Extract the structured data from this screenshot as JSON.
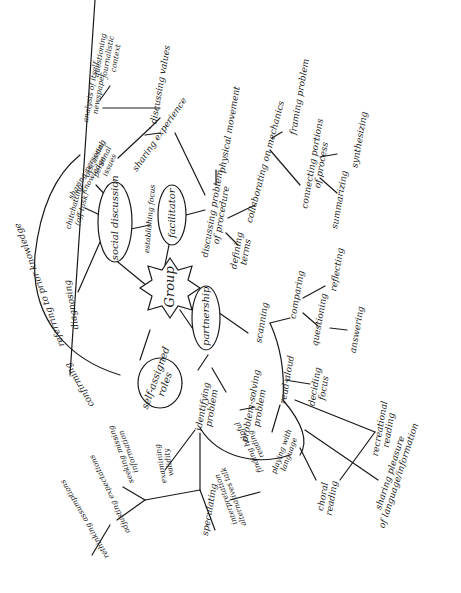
{
  "diagram": {
    "type": "concept-map",
    "orientation": "rotated-90-ccw",
    "style": "hand-drawn",
    "center": "Group",
    "hubs": {
      "social_discussion": "social discussion",
      "facilitator": "facilitator",
      "partnership": "partnership",
      "self_assigned_roles": "self-assigned\nroles"
    },
    "labels": {
      "questioning_journalistic_context": "questioning\njournalistic\ncontext",
      "analysis_of_itself": "analysis of itself\nnewspaper",
      "discussing_values": "discussing values",
      "sharing_experience": "sharing experience",
      "discussing_personal_issues": "discussing\npersonal\nissues",
      "physical_movement": "physical movement",
      "discussing_problem_procedure": "discussing problem\nof procedure",
      "collaborating_on_mechanics": "collaborating on mechanics",
      "framing_problem": "framing problem",
      "connecting_portions": "connecting portions\nof process",
      "synthesizing": "synthesizing",
      "summarizing": "summarizing",
      "defining_terms": "defining\nterms",
      "establishing_focus": "establishing focus",
      "sharing_personal_knowledge": "sharing personal\nknowledge",
      "chitchatting": "chitchatting\n(off-task)",
      "diagnosing": "diagnosing",
      "referring_prior_knowledge": "referring to prior knowledge",
      "confirming": "confirming",
      "scanning": "scanning",
      "comparing": "comparing",
      "reflecting": "reflecting",
      "questioning": "questioning",
      "answering": "answering",
      "read_aloud": "read-aloud",
      "deciding_focus": "deciding\nfocus",
      "recreational_reading": "recreational\nreading",
      "sharing_pleasure": "sharing pleasure\nof language/information",
      "choral_reading": "choral\nreading",
      "playing_with_language": "playing with\nlanguage",
      "problem_solving_problem": "problem-solving\nproblem",
      "identifying_problem": "identifying\nproblem",
      "finding_helpful_text": "finding helpful\nreading",
      "interpretation_alternatives": "interpretation\nalternatives talk",
      "speculating": "speculating",
      "examining_validity": "examining\nvalidity",
      "seeking_missing_info": "seeking missing\ninformation",
      "adjusting_expectations": "adjusting expectations",
      "rethinking_assumptions": "rethinking assumptions"
    }
  }
}
